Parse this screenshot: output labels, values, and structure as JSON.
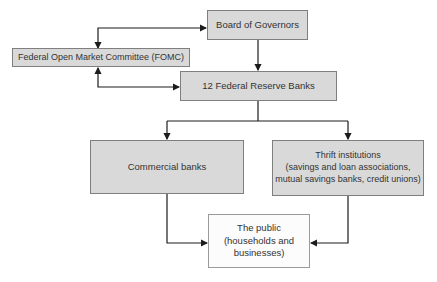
{
  "diagram": {
    "nodes": {
      "board": {
        "label": "Board of Governors"
      },
      "fomc": {
        "label": "Federal Open Market Committee (FOMC)"
      },
      "reserve_banks": {
        "label": "12 Federal Reserve Banks"
      },
      "commercial_banks": {
        "label": "Commercial banks"
      },
      "thrift_institutions": {
        "label": "Thrift institutions\n(savings and loan associations,\nmutual savings banks, credit unions)"
      },
      "public": {
        "label": "The public\n(households and\nbusinesses)"
      }
    },
    "edges": [
      {
        "from": "fomc",
        "to": "board",
        "direction": "bidirectional"
      },
      {
        "from": "fomc",
        "to": "reserve_banks",
        "direction": "bidirectional"
      },
      {
        "from": "board",
        "to": "reserve_banks",
        "direction": "down"
      },
      {
        "from": "reserve_banks",
        "to": "commercial_banks",
        "direction": "down"
      },
      {
        "from": "reserve_banks",
        "to": "thrift_institutions",
        "direction": "down"
      },
      {
        "from": "commercial_banks",
        "to": "public",
        "direction": "into"
      },
      {
        "from": "thrift_institutions",
        "to": "public",
        "direction": "into"
      }
    ],
    "colors": {
      "node_fill": "#d9d9d9",
      "node_border": "#7f7f7f",
      "public_fill": "#fcfcfc",
      "public_border": "#9a9a9a",
      "arrow": "#1c1c1c",
      "text": "#333333",
      "background": "#ffffff"
    }
  }
}
